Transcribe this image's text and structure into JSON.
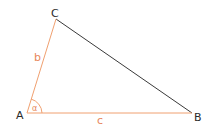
{
  "diagram": {
    "type": "triangle",
    "colors": {
      "highlight": "#f0a070",
      "side_a": "#3a3a3a",
      "label_dark": "#2a2a2a",
      "label_accent": "#e8875a"
    },
    "vertices": [
      {
        "name": "A",
        "label": "A",
        "x": 27,
        "y": 113
      },
      {
        "name": "B",
        "label": "B",
        "x": 192,
        "y": 113
      },
      {
        "name": "C",
        "label": "C",
        "x": 56,
        "y": 19
      }
    ],
    "sides": [
      {
        "name": "b",
        "label": "b",
        "from": "A",
        "to": "C",
        "highlighted": true
      },
      {
        "name": "c",
        "label": "c",
        "from": "A",
        "to": "B",
        "highlighted": true
      },
      {
        "name": "a",
        "label": "",
        "from": "C",
        "to": "B",
        "highlighted": false
      }
    ],
    "angle": {
      "vertex": "A",
      "label": "α"
    }
  }
}
